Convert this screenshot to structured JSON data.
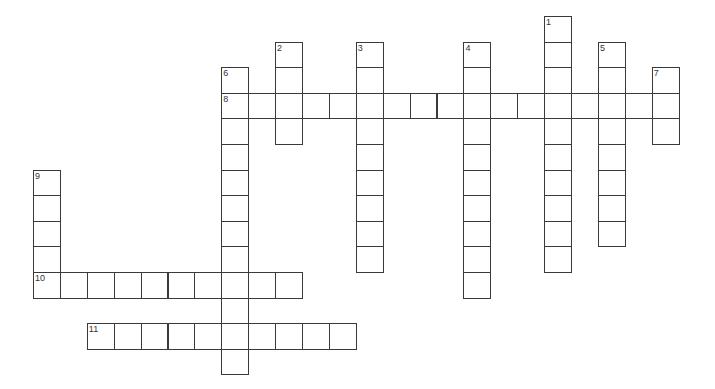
{
  "puzzle": {
    "type": "crossword",
    "grid": {
      "origin_x": 33,
      "origin_y": 16,
      "cell_w": 26.9,
      "cell_h": 25.6
    },
    "entries": [
      {
        "number": "1",
        "direction": "down",
        "col": 19,
        "row": 0,
        "length": 10
      },
      {
        "number": "2",
        "direction": "down",
        "col": 9,
        "row": 1,
        "length": 4
      },
      {
        "number": "3",
        "direction": "down",
        "col": 12,
        "row": 1,
        "length": 9
      },
      {
        "number": "4",
        "direction": "down",
        "col": 16,
        "row": 1,
        "length": 10
      },
      {
        "number": "5",
        "direction": "down",
        "col": 21,
        "row": 1,
        "length": 8
      },
      {
        "number": "6",
        "direction": "down",
        "col": 7,
        "row": 2,
        "length": 12
      },
      {
        "number": "7",
        "direction": "down",
        "col": 23,
        "row": 2,
        "length": 3
      },
      {
        "number": "8",
        "direction": "across",
        "col": 7,
        "row": 3,
        "length": 17
      },
      {
        "number": "9",
        "direction": "down",
        "col": 0,
        "row": 6,
        "length": 5
      },
      {
        "number": "10",
        "direction": "across",
        "col": 0,
        "row": 10,
        "length": 10
      },
      {
        "number": "11",
        "direction": "across",
        "col": 2,
        "row": 12,
        "length": 10
      }
    ]
  }
}
